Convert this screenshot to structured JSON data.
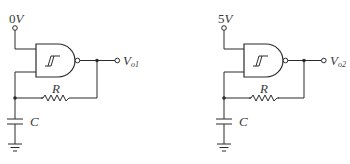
{
  "diagram": {
    "type": "circuit-schematic",
    "circuits": [
      {
        "id": "circuit-1",
        "supply_label_num": "0",
        "supply_label_unit": "V",
        "gate_symbol": "Schmitt-trigger NAND",
        "resistor_label": "R",
        "capacitor_label": "C",
        "output_label_main": "V",
        "output_label_sub": "o1"
      },
      {
        "id": "circuit-2",
        "supply_label_num": "5",
        "supply_label_unit": "V",
        "gate_symbol": "Schmitt-trigger NAND",
        "resistor_label": "R",
        "capacitor_label": "C",
        "output_label_main": "V",
        "output_label_sub": "o2"
      }
    ],
    "colors": {
      "line": "#2b2b2b",
      "text": "#3a3a3a",
      "background": "#ffffff"
    }
  }
}
